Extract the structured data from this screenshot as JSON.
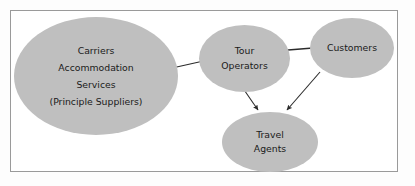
{
  "diagram": {
    "type": "relationship-diagram",
    "frame": {
      "border_color": "#9a9a9a",
      "background": "#ffffff"
    },
    "style": {
      "node_fill": "#bfbfbf",
      "node_shape": "ellipse",
      "text_color": "#1a1a1a",
      "edge_color": "#2b2b2b"
    },
    "nodes": [
      {
        "id": "principal-suppliers",
        "lines": [
          "Carriers",
          "Accommodation",
          "Services",
          "(Principle Suppliers)"
        ]
      },
      {
        "id": "tour-operators",
        "lines": [
          "Tour",
          "Operators"
        ]
      },
      {
        "id": "customers",
        "lines": [
          "Customers"
        ]
      },
      {
        "id": "travel-agents",
        "lines": [
          "Travel",
          "Agents"
        ]
      }
    ],
    "edges": [
      {
        "id": "suppliers-to-tour-operators",
        "from": "principal-suppliers",
        "to": "tour-operators",
        "arrow": "none"
      },
      {
        "id": "tour-operators-to-customers",
        "from": "tour-operators",
        "to": "customers",
        "arrow": "none"
      },
      {
        "id": "tour-operators-to-travel-agents",
        "from": "tour-operators",
        "to": "travel-agents",
        "arrow": "end"
      },
      {
        "id": "customers-to-travel-agents",
        "from": "customers",
        "to": "travel-agents",
        "arrow": "end"
      }
    ]
  }
}
